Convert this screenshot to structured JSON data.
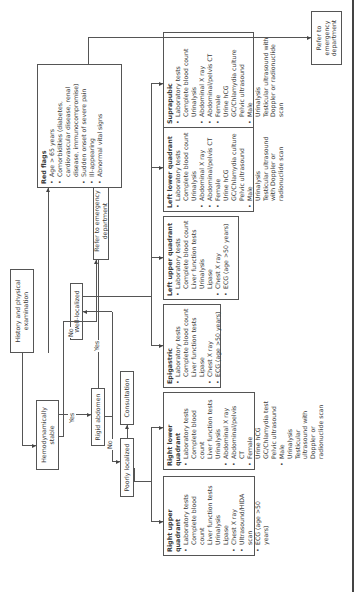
{
  "flowchart": {
    "history": "History and physical examination",
    "hemodynamically_stable": "Hemodynamically stable",
    "rigid_abdomen": "Rigid abdomen",
    "poorly_localized": "Poorly localized",
    "consultation": "Consultation",
    "well_localized": "Well-localized",
    "refer_ed_1": "Refer to emergency department",
    "refer_ed_2": "Refer to emergency department",
    "edge_labels": {
      "yes_stable": "Yes",
      "no_stable": "No",
      "yes_rigid": "Yes",
      "no_rigid": "No"
    },
    "red_flags": {
      "title": "Red flags",
      "items": [
        "Age > 65 years",
        "Comorbidities (diabetes, cardiovascular disease, renal disease, immunocompromise)",
        "Sudden onset of severe pain",
        "Ill-appearing",
        "Abnormal vital signs"
      ]
    },
    "right_upper_quadrant": {
      "title": "Right upper quadrant",
      "items": [
        {
          "label": "Laboratory tests",
          "sub": [
            "Complete blood count",
            "Liver function tests",
            "Urinalysis",
            "Lipase"
          ]
        },
        {
          "label": "Chest X ray",
          "sub": []
        },
        {
          "label": "Ultrasound/HIDA scan",
          "sub": []
        },
        {
          "label": "ECG (age >50 years)",
          "sub": []
        }
      ]
    },
    "right_lower_quadrant": {
      "title": "Right lower quadrant",
      "items": [
        {
          "label": "Laboratory tests",
          "sub": [
            "Complete blood count",
            "Liver function tests",
            "Urinalysis"
          ]
        },
        {
          "label": "Abdominal X ray",
          "sub": []
        },
        {
          "label": "Abdominal/pelvis CT",
          "sub": []
        },
        {
          "label": "Female",
          "sub": [
            "Urine hCG",
            "GC/Chlamydia test",
            "Pelvic ultrasound"
          ]
        },
        {
          "label": "Male",
          "sub": [
            "Urinalysis",
            "Testicular ultrasound with Doppler or radionuclide scan"
          ]
        }
      ]
    },
    "epigastric": {
      "title": "Epigastric",
      "items": [
        {
          "label": "Laboratory tests",
          "sub": [
            "Complete blood count",
            "Liver function tests",
            "Lipase"
          ]
        },
        {
          "label": "Chest X ray",
          "sub": []
        },
        {
          "label": "ECG (age >50 years)",
          "sub": []
        }
      ]
    },
    "left_upper_quadrant": {
      "title": "Left upper quadrant",
      "items": [
        {
          "label": "Laboratory tests",
          "sub": [
            "Complete blood count",
            "Liver function tests",
            "Urinalysis",
            "Lipase"
          ]
        },
        {
          "label": "Chest X ray",
          "sub": []
        },
        {
          "label": "ECG (age >50 years)",
          "sub": []
        }
      ]
    },
    "left_lower_quadrant": {
      "title": "Left lower quadrant",
      "items": [
        {
          "label": "Laboratory tests",
          "sub": [
            "Complete blood count",
            "Urinalysis"
          ]
        },
        {
          "label": "Abdominal X ray",
          "sub": []
        },
        {
          "label": "Abdominal/pelvis CT",
          "sub": []
        },
        {
          "label": "Female",
          "sub": [
            "Urine hCG",
            "GC/Chlamydia culture",
            "Pelvic ultrasound"
          ]
        },
        {
          "label": "Male",
          "sub": [
            "Urinalysis",
            "Testicular ultrasound with Doppler or radionuclide scan"
          ]
        }
      ]
    },
    "suprapubic": {
      "title": "Suprapubic",
      "items": [
        {
          "label": "Laboratory tests",
          "sub": [
            "Complete blood count",
            "Urinalysis"
          ]
        },
        {
          "label": "Abdominal X ray",
          "sub": []
        },
        {
          "label": "Abdominal/pelvis CT",
          "sub": []
        },
        {
          "label": "Female",
          "sub": [
            "Urine hCG",
            "GC/Chlamydia culture",
            "Pelvic ultrasound"
          ]
        },
        {
          "label": "Male",
          "sub": [
            "Urinalysis",
            "Testicular ultrasound with Doppler or radionuclide scan"
          ]
        }
      ]
    }
  }
}
